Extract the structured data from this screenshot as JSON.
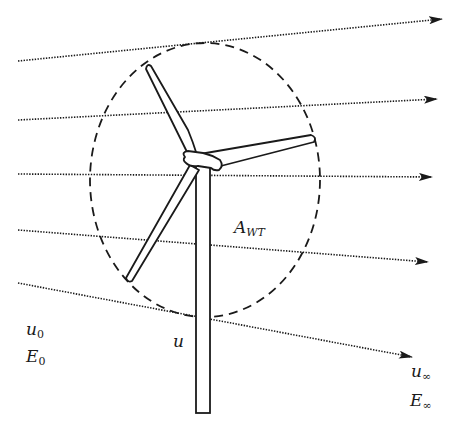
{
  "diagram": {
    "type": "wind-turbine-streamtube",
    "colors": {
      "ink": "#1a1a1a",
      "background": "#ffffff"
    },
    "labels": {
      "upstream_velocity": {
        "main": "u",
        "sub": "0"
      },
      "upstream_energy": {
        "main": "E",
        "sub": "0"
      },
      "rotor_velocity": {
        "main": "u"
      },
      "rotor_area": {
        "main": "A",
        "sub": "WT"
      },
      "downstream_velocity": {
        "main": "u",
        "sub": "∞"
      },
      "downstream_energy": {
        "main": "E",
        "sub": "∞"
      }
    },
    "streamlines": [
      {
        "x1": 18,
        "y1": 61,
        "x2": 442,
        "y2": 19
      },
      {
        "x1": 18,
        "y1": 120,
        "x2": 437,
        "y2": 99
      },
      {
        "x1": 18,
        "y1": 174,
        "x2": 432,
        "y2": 177
      },
      {
        "x1": 18,
        "y1": 230,
        "x2": 428,
        "y2": 262
      },
      {
        "x1": 18,
        "y1": 283,
        "x2": 412,
        "y2": 357
      }
    ],
    "swept_area": {
      "cx": 205,
      "cy": 180,
      "rx": 115,
      "ry": 137
    },
    "turbine": {
      "hub": {
        "x": 195,
        "y": 160
      },
      "blade_tips": [
        {
          "name": "top",
          "x": 148,
          "y": 65
        },
        {
          "name": "right",
          "x": 313,
          "y": 138
        },
        {
          "name": "lower-left",
          "x": 128,
          "y": 280
        }
      ],
      "tower": {
        "x_left": 196,
        "x_right": 210,
        "y_top": 168,
        "y_bottom": 413
      }
    }
  }
}
